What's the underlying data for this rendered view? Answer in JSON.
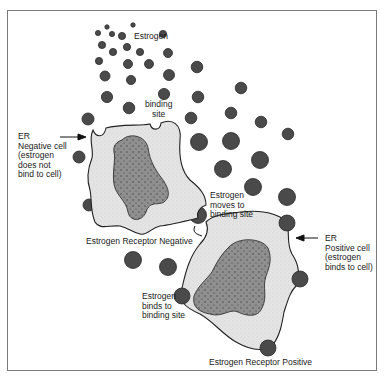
{
  "figure": {
    "labels": {
      "estrogen": "Estrogen",
      "binding_site": "binding\nsite",
      "er_negative_cell": "ER\nNegative cell\n(estrogen\ndoes not\nbind to cell)",
      "er_negative_caption": "Estrogen Receptor Negative",
      "moves_to_binding_site": "Estrogen\nmoves to\nbinding site",
      "er_positive_cell": "ER\nPositive cell\n(estrogen\nbinds to cell)",
      "binds_to_binding_site": "Estrogen\nbinds to\nbinding site",
      "er_positive_caption": "Estrogen Receptor Positive"
    },
    "colors": {
      "estrogen_dot": "#4a4a4a",
      "cell_cytoplasm": "#e2e2e2",
      "nucleus": "#8f8f8f",
      "outline": "#222222"
    }
  }
}
